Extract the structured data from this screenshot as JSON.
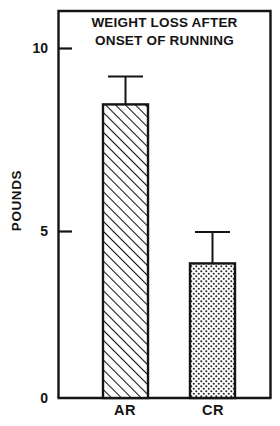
{
  "chart_data": {
    "type": "bar",
    "title": "WEIGHT LOSS AFTER ONSET OF RUNNING",
    "title_line1": "WEIGHT LOSS AFTER",
    "title_line2": "ONSET OF RUNNING",
    "xlabel": "",
    "ylabel": "POUNDS",
    "categories": [
      "AR",
      "CR"
    ],
    "values": [
      8.4,
      3.85
    ],
    "errors_upper": [
      9.2,
      4.75
    ],
    "errors_lower": [
      7.55,
      2.85
    ],
    "error_bars": true,
    "ylim": [
      0,
      10.6
    ],
    "yticks": [
      0,
      5,
      10
    ],
    "ytick_labels": [
      "0",
      "5",
      "10"
    ],
    "grid": false,
    "legend": false,
    "bar_fills": [
      "diagonal-hatch",
      "dotted-stipple"
    ],
    "colors": {
      "line": "#141414",
      "background": "#ffffff",
      "bar_fill": "#ffffff"
    }
  },
  "axis": {
    "y_tick_10": "10",
    "y_tick_5": "5",
    "y_tick_0": "0",
    "cat_ar": "AR",
    "cat_cr": "CR",
    "y_title": "POUNDS"
  },
  "title": {
    "line1": "WEIGHT LOSS AFTER",
    "line2": "ONSET OF RUNNING"
  }
}
